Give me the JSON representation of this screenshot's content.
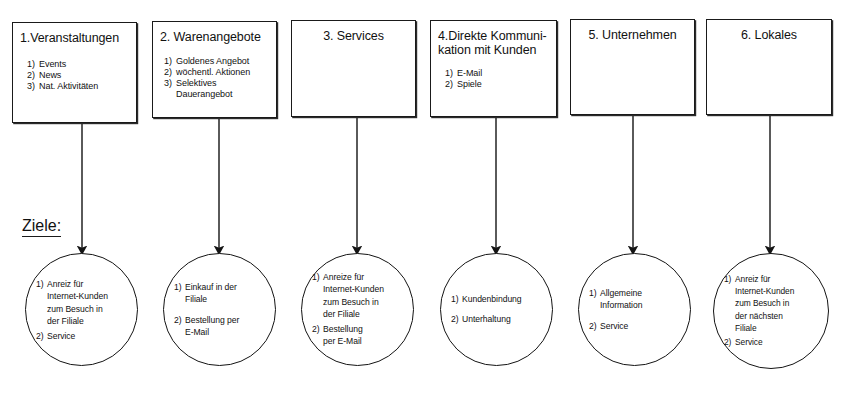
{
  "diagram": {
    "goals_label": "Ziele:",
    "categories": [
      {
        "title": "1.Veranstaltungen",
        "items": [
          "Events",
          "News",
          "Nat. Aktivitäten"
        ],
        "goal_items": [
          "Anreiz für\nInternet-Kunden\nzum Besuch in\nder Filiale",
          "Service"
        ]
      },
      {
        "title": "2. Warenangebote",
        "items": [
          "Goldenes Angebot",
          "wöchentl. Aktionen",
          "Selektives\nDauerangebot"
        ],
        "goal_items": [
          "Einkauf in der\nFiliale",
          "Bestellung per\nE-Mail"
        ]
      },
      {
        "title": "3. Services",
        "items": [],
        "goal_items": [
          "Anreize für\nInternet-Kunden\nzum Besuch in\nder Filiale",
          "Bestellung\nper E-Mail"
        ]
      },
      {
        "title": "4.Direkte Kommuni-\n   kation mit Kunden",
        "items": [
          "E-Mail",
          "Spiele"
        ],
        "goal_items": [
          "Kundenbindung",
          "Unterhaltung"
        ]
      },
      {
        "title": "5. Unternehmen",
        "items": [],
        "goal_items": [
          "Allgemeine\nInformation",
          "Service"
        ]
      },
      {
        "title": "6. Lokales",
        "items": [],
        "goal_items": [
          "Anreiz für\nInternet-Kunden\nzum Besuch in\nder nächsten\nFiliale",
          "Service"
        ]
      }
    ],
    "numbering": [
      "1)",
      "2)",
      "3)"
    ],
    "colors": {
      "stroke": "#1a1a1a",
      "background": "#ffffff",
      "text": "#111111"
    }
  }
}
